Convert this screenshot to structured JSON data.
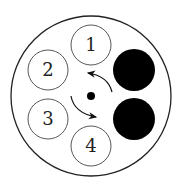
{
  "diagram": {
    "outer": {
      "cx": 91,
      "cy": 96,
      "r": 80
    },
    "center_dot": {
      "cx": 91,
      "cy": 96,
      "r": 4
    },
    "numbered_circles": [
      {
        "label": "1",
        "cx": 91,
        "cy": 45,
        "r": 20
      },
      {
        "label": "2",
        "cx": 48,
        "cy": 70,
        "r": 20
      },
      {
        "label": "3",
        "cx": 48,
        "cy": 119,
        "r": 20
      },
      {
        "label": "4",
        "cx": 91,
        "cy": 146,
        "r": 20
      }
    ],
    "filled_circles": [
      {
        "cx": 134,
        "cy": 70,
        "r": 21
      },
      {
        "cx": 134,
        "cy": 119,
        "r": 21
      }
    ],
    "colors": {
      "stroke": "#222222",
      "fill": "#000000",
      "background": "#ffffff"
    }
  }
}
